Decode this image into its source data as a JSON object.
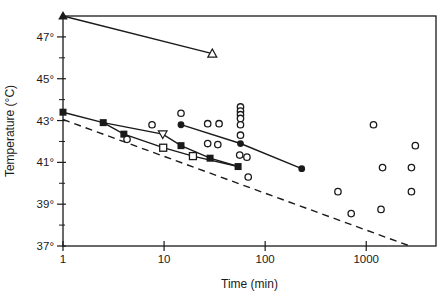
{
  "chart_data": {
    "type": "scatter",
    "title": "",
    "xlabel": "Time (min)",
    "ylabel": "Temperature (°C)",
    "x_scale": "log",
    "xlim": [
      1,
      4900
    ],
    "ylim": [
      37,
      48
    ],
    "x_ticks": [
      1,
      10,
      100,
      1000
    ],
    "y_major_ticks": [
      47,
      45,
      43,
      41,
      39,
      37
    ],
    "y_minor_ticks": [
      46,
      44,
      42,
      40,
      38
    ],
    "y_tick_suffix": "°",
    "grid": false,
    "legend": "none",
    "frame": "full-box",
    "line_color": "#1a1a1a",
    "series": [
      {
        "name": "triangle-line",
        "style": "solid",
        "points": [
          {
            "t": 1,
            "T": 48.0,
            "marker": "filled-triangle"
          },
          {
            "t": 30,
            "T": 46.2,
            "marker": "open-triangle"
          }
        ]
      },
      {
        "name": "filled-square-line",
        "style": "solid",
        "points": [
          {
            "t": 1,
            "T": 43.4,
            "marker": "filled-square"
          },
          {
            "t": 2.5,
            "T": 42.9,
            "marker": "filled-square"
          },
          {
            "t": 9.7,
            "T": 42.35,
            "marker": "open-inverted-triangle"
          },
          {
            "t": 14.7,
            "T": 41.8,
            "marker": "filled-square"
          },
          {
            "t": 28.5,
            "T": 41.2,
            "marker": "filled-square"
          },
          {
            "t": 54,
            "T": 40.8,
            "marker": "filled-square"
          }
        ]
      },
      {
        "name": "open-square-line",
        "style": "solid",
        "points": [
          {
            "t": 2.5,
            "T": 42.9,
            "marker": "none"
          },
          {
            "t": 4.0,
            "T": 42.35,
            "marker": "filled-square"
          },
          {
            "t": 9.8,
            "T": 41.7,
            "marker": "open-square"
          },
          {
            "t": 19.3,
            "T": 41.3,
            "marker": "open-square"
          },
          {
            "t": 54,
            "T": 40.8,
            "marker": "none"
          }
        ]
      },
      {
        "name": "filled-circle-line",
        "style": "solid",
        "points": [
          {
            "t": 14.7,
            "T": 42.8,
            "marker": "filled-circle"
          },
          {
            "t": 57,
            "T": 41.9,
            "marker": "filled-circle"
          },
          {
            "t": 230,
            "T": 40.7,
            "marker": "filled-circle"
          }
        ]
      },
      {
        "name": "dashed-threshold-line",
        "style": "dashed",
        "points": [
          {
            "t": 1,
            "T": 43.05,
            "marker": "none"
          },
          {
            "t": 2700,
            "T": 37.0,
            "marker": "none"
          }
        ]
      },
      {
        "name": "open-circle-scatter",
        "style": "markers-only",
        "points": [
          {
            "t": 4.3,
            "T": 42.1,
            "marker": "open-circle"
          },
          {
            "t": 7.6,
            "T": 42.8,
            "marker": "open-circle"
          },
          {
            "t": 14.7,
            "T": 43.35,
            "marker": "open-circle"
          },
          {
            "t": 27,
            "T": 42.85,
            "marker": "open-circle"
          },
          {
            "t": 35,
            "T": 42.85,
            "marker": "open-circle"
          },
          {
            "t": 27,
            "T": 41.9,
            "marker": "open-circle"
          },
          {
            "t": 34,
            "T": 41.85,
            "marker": "open-circle"
          },
          {
            "t": 57,
            "T": 43.65,
            "marker": "open-circle"
          },
          {
            "t": 57,
            "T": 43.45,
            "marker": "open-circle"
          },
          {
            "t": 57,
            "T": 43.28,
            "marker": "open-circle"
          },
          {
            "t": 57,
            "T": 43.1,
            "marker": "open-circle"
          },
          {
            "t": 57,
            "T": 42.8,
            "marker": "open-circle"
          },
          {
            "t": 57,
            "T": 42.3,
            "marker": "open-circle"
          },
          {
            "t": 56,
            "T": 41.35,
            "marker": "open-circle"
          },
          {
            "t": 66,
            "T": 41.25,
            "marker": "open-circle"
          },
          {
            "t": 68,
            "T": 40.3,
            "marker": "open-circle"
          },
          {
            "t": 525,
            "T": 39.6,
            "marker": "open-circle"
          },
          {
            "t": 710,
            "T": 38.55,
            "marker": "open-circle"
          },
          {
            "t": 1180,
            "T": 42.8,
            "marker": "open-circle"
          },
          {
            "t": 1400,
            "T": 38.75,
            "marker": "open-circle"
          },
          {
            "t": 1450,
            "T": 40.75,
            "marker": "open-circle"
          },
          {
            "t": 2800,
            "T": 40.75,
            "marker": "open-circle"
          },
          {
            "t": 2800,
            "T": 39.6,
            "marker": "open-circle"
          },
          {
            "t": 3060,
            "T": 41.8,
            "marker": "open-circle"
          }
        ]
      }
    ]
  }
}
